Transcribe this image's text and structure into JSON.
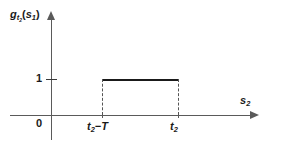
{
  "chart_data": {
    "type": "line",
    "title": "",
    "subtitle": "",
    "xlabel": "s_1",
    "ylabel": "g_{t_2}(s_1)",
    "xlabel_display": "s",
    "xlabel_sub": "1",
    "ylabel_parts": {
      "base": "g",
      "base_sub": "t",
      "base_sub_sub": "2",
      "arg_open": "(",
      "arg": "s",
      "arg_sub": "1",
      "arg_close": ")"
    },
    "grid": false,
    "legend": "none",
    "ylim": [
      0,
      1.45
    ],
    "xlim_note": "axis unscaled, arrow-terminated",
    "y_ticks": [
      {
        "value": 1,
        "label": "1"
      }
    ],
    "x_ticks": [
      {
        "label_base": "t",
        "label_sub": "2",
        "label_tail": "−T",
        "position": "t_2 - T"
      },
      {
        "label_base": "t",
        "label_sub": "2",
        "label_tail": "",
        "position": "t_2"
      }
    ],
    "origin_label": "0",
    "series": [
      {
        "name": "g_{t_2}(s_1)",
        "shape": "rectangular pulse",
        "amplitude": 1,
        "support_start": "t_2 - T",
        "support_end": "t_2",
        "points": [
          {
            "x": "t_2 - T",
            "y": 1
          },
          {
            "x": "t_2",
            "y": 1
          }
        ],
        "style": {
          "top_line": "solid",
          "vertical_edges": "dashed"
        }
      }
    ],
    "colors": {
      "background": "#ffffff",
      "axis": "#5a5a5a",
      "pulse_line": "#1a1a1a",
      "dashed_edge": "#555555",
      "text": "#1a1a1a"
    }
  }
}
